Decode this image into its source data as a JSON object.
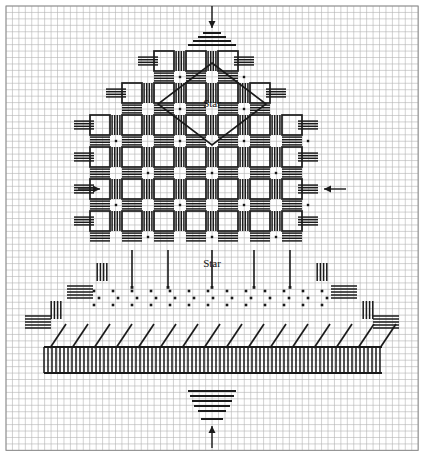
{
  "document": {
    "kind": "needlework-chart",
    "title": "Filet crochet / cross-stitch pattern chart",
    "background_color": "#ffffff",
    "ink_color": "#1a1a1a",
    "grid_line_color": "#b4b4b4",
    "grid_major_color": "#8c8c8c"
  },
  "canvas": {
    "width": 424,
    "height": 456
  },
  "grid": {
    "cell_size": 6.44,
    "columns": 64,
    "rows": 69,
    "major_every": 0,
    "origin_x": 6,
    "origin_y": 6,
    "visible": true
  },
  "labels": [
    {
      "name": "star-label-top",
      "text": "Star",
      "x": 212,
      "y": 104
    },
    {
      "name": "star-label-bottom",
      "text": "Star",
      "x": 212,
      "y": 264
    }
  ],
  "arrows": [
    {
      "name": "arrow-top",
      "direction": "down",
      "x": 212,
      "y": 6,
      "length": 22
    },
    {
      "name": "arrow-bottom",
      "direction": "up",
      "x": 212,
      "y": 448,
      "length": 22
    },
    {
      "name": "arrow-left",
      "direction": "right",
      "x": 78,
      "y": 189,
      "length": 22
    },
    {
      "name": "arrow-right",
      "direction": "left",
      "x": 346,
      "y": 189,
      "length": 22
    }
  ],
  "motifs": {
    "diamond": {
      "name": "star-diamond",
      "cx": 212,
      "cy": 104,
      "half_w": 54,
      "half_h": 41
    },
    "top_pyramid": {
      "name": "top-step-pyramid",
      "rows": [
        {
          "y": 33,
          "half": 9
        },
        {
          "y": 37,
          "half": 14
        },
        {
          "y": 41,
          "half": 19
        },
        {
          "y": 45,
          "half": 24
        }
      ]
    },
    "bottom_pyramid": {
      "name": "bottom-step-pyramid",
      "rows": [
        {
          "y": 391,
          "half": 24
        },
        {
          "y": 396,
          "half": 22
        },
        {
          "y": 401,
          "half": 20
        },
        {
          "y": 406,
          "half": 18
        },
        {
          "y": 411,
          "half": 14
        },
        {
          "y": 419,
          "half": 11
        }
      ]
    },
    "lattice": {
      "name": "lattice-block-field",
      "description": "triangular field of open squares separated by hatched bands",
      "block_pitch": 32,
      "rows": [
        {
          "row": 0,
          "y": 61,
          "blocks": 3,
          "x_start": 164
        },
        {
          "row": 1,
          "y": 93,
          "blocks": 5,
          "x_start": 132
        },
        {
          "row": 2,
          "y": 125,
          "blocks": 7,
          "x_start": 100
        },
        {
          "row": 3,
          "y": 157,
          "blocks": 7,
          "x_start": 100
        },
        {
          "row": 4,
          "y": 189,
          "blocks": 7,
          "x_start": 100
        },
        {
          "row": 5,
          "y": 221,
          "blocks": 7,
          "x_start": 100
        }
      ]
    },
    "dot_band": {
      "name": "dotted-band",
      "y_rows": [
        291,
        298,
        305
      ],
      "x_start": 94,
      "x_end": 330,
      "group_pitch": 19
    },
    "hatch_band": {
      "name": "diagonal-hatch-band",
      "y_top": 322,
      "y_bottom": 348,
      "x_start": 44,
      "x_end": 382,
      "stroke_pitch": 22,
      "count": 16
    },
    "comb_band": {
      "name": "vertical-comb-band",
      "y_top": 347,
      "y_bottom": 373,
      "x_start": 44,
      "x_end": 382,
      "tooth_pitch": 4
    }
  },
  "legend": {
    "symbols": [
      {
        "name": "open-square",
        "meaning": "open mesh block"
      },
      {
        "name": "horizontal-bars",
        "meaning": "filled / solid block"
      },
      {
        "name": "vertical-bars",
        "meaning": "filled / solid block"
      },
      {
        "name": "dot",
        "meaning": "single stitch"
      },
      {
        "name": "diagonal-stroke",
        "meaning": "slanted stitch"
      }
    ]
  }
}
